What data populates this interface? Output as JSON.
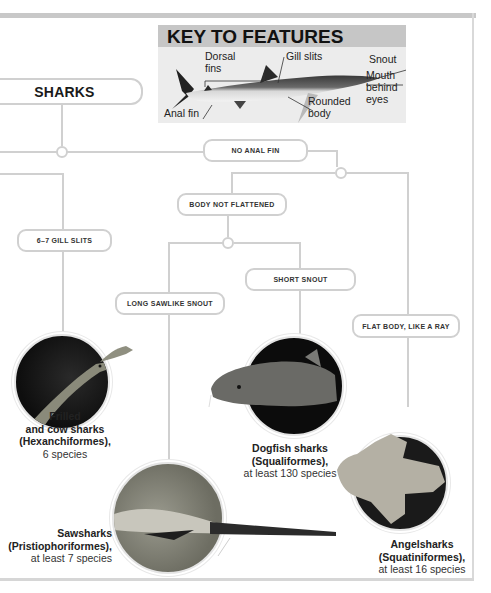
{
  "key": {
    "title": "KEY TO FEATURES",
    "labels": {
      "dorsal": "Dorsal fins",
      "dorsal_l1": "Dorsal",
      "dorsal_l2": "fins",
      "gill": "Gill slits",
      "snout": "Snout",
      "mouth_l1": "Mouth",
      "mouth_l2": "behind",
      "mouth_l3": "eyes",
      "anal": "Anal fin",
      "body_l1": "Rounded",
      "body_l2": "body"
    }
  },
  "tree": {
    "root": "SHARKS",
    "nodes": {
      "no_anal_fin": "NO ANAL FIN",
      "gill_slits": "6–7 GILL SLITS",
      "body_not_flattened": "BODY NOT FLATTENED",
      "long_sawlike_snout": "LONG SAWLIKE SNOUT",
      "short_snout": "SHORT SNOUT",
      "flat_body": "FLAT BODY, LIKE A RAY"
    }
  },
  "groups": [
    {
      "name_l1": "Frilled",
      "name_l2": "and cow sharks",
      "order": "(Hexanchiformes),",
      "count": "6 species"
    },
    {
      "name_l1": "Sawsharks",
      "order": "(Pristiophoriformes),",
      "count": "at least 7 species"
    },
    {
      "name_l1": "Dogfish sharks",
      "order": "(Squaliformes),",
      "count": "at least 130 species"
    },
    {
      "name_l1": "Angelsharks",
      "order": "(Squatiniformes),",
      "count": "at least 16 species"
    }
  ],
  "colors": {
    "connector": "#d0d0d0",
    "key_header": "#c6c6c6",
    "key_body": "#ececec"
  }
}
